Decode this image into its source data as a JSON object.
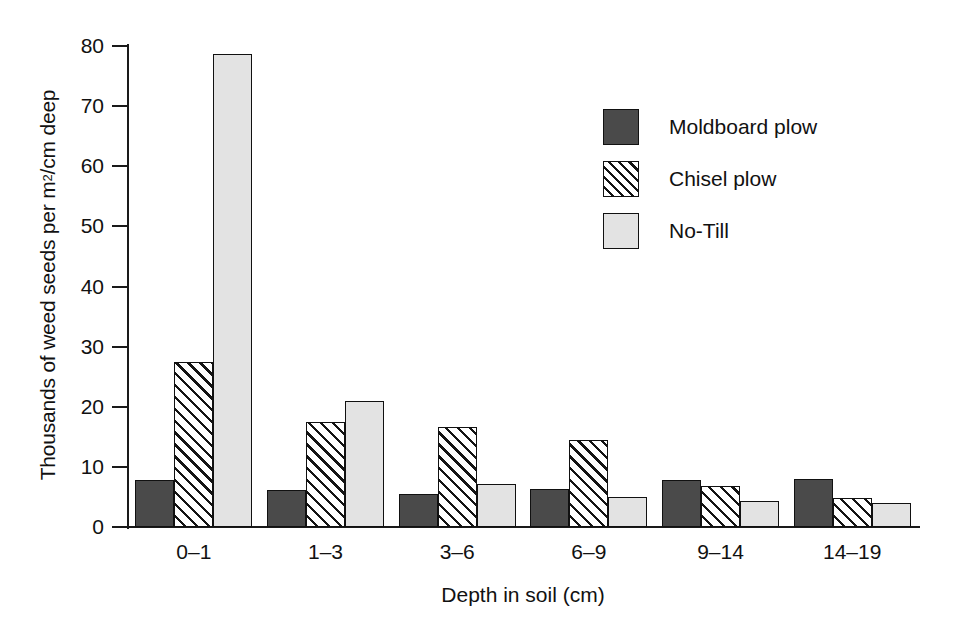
{
  "chart_data": {
    "type": "bar",
    "title": "",
    "subtitle": "",
    "xlabel": "Depth in soil (cm)",
    "ylabel": "Thousands of weed seeds per m2/cm deep",
    "ylabel_parts": {
      "before_sup": "Thousands of weed seeds per m",
      "sup": "2",
      "after_sup": "/cm deep"
    },
    "categories": [
      "0–1",
      "1–3",
      "3–6",
      "6–9",
      "9–14",
      "14–19"
    ],
    "series": [
      {
        "name": "Moldboard plow",
        "fill": "solid-dark",
        "color": "#4a4a4a",
        "values": [
          7.8,
          6.1,
          5.5,
          6.4,
          7.9,
          8.0
        ]
      },
      {
        "name": "Chisel plow",
        "fill": "diagonal-hatch",
        "color": "#ffffff",
        "values": [
          27.5,
          17.5,
          16.7,
          14.4,
          6.9,
          4.9
        ]
      },
      {
        "name": "No-Till",
        "fill": "solid-light",
        "color": "#e3e3e3",
        "values": [
          78.7,
          21.0,
          7.2,
          5.0,
          4.3,
          4.0
        ]
      }
    ],
    "ylim": [
      0,
      80
    ],
    "yticks": [
      0,
      10,
      20,
      30,
      40,
      50,
      60,
      70,
      80
    ],
    "ytick_labels": [
      "0",
      "10",
      "20",
      "30",
      "40",
      "50",
      "60",
      "70",
      "80"
    ],
    "grid": false,
    "legend_position": "upper right",
    "axis_color": "#111111",
    "background": "#ffffff"
  },
  "legend": {
    "entries": [
      {
        "label": "Moldboard plow",
        "style": "moldboard"
      },
      {
        "label": "Chisel plow",
        "style": "chisel"
      },
      {
        "label": "No-Till",
        "style": "notill"
      }
    ]
  }
}
